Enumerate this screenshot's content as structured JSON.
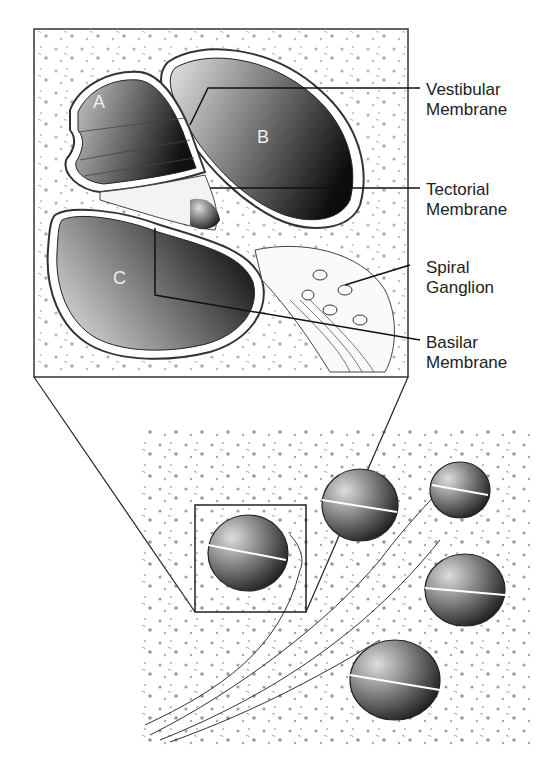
{
  "diagram": {
    "chambers": [
      {
        "id": "A",
        "label": "A"
      },
      {
        "id": "B",
        "label": "B"
      },
      {
        "id": "C",
        "label": "C"
      }
    ],
    "callouts": [
      {
        "line1": "Vestibular",
        "line2": "Membrane"
      },
      {
        "line1": "Tectorial",
        "line2": "Membrane"
      },
      {
        "line1": "Spiral",
        "line2": "Ganglion"
      },
      {
        "line1": "Basilar",
        "line2": "Membrane"
      }
    ],
    "colors": {
      "ink": "#222222",
      "chamber_dark": "#1a1a1a",
      "chamber_light": "#cfcfcf"
    }
  }
}
